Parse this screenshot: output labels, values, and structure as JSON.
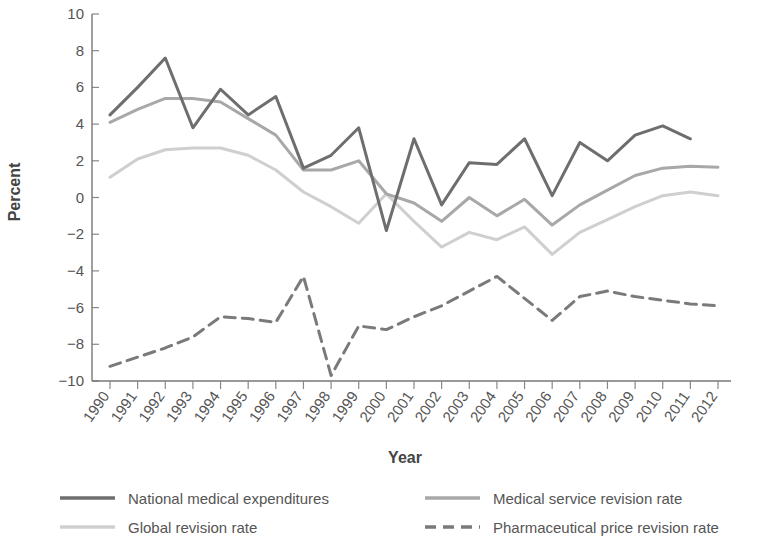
{
  "chart_data": {
    "type": "line",
    "title": "",
    "xlabel": "Year",
    "ylabel": "Percent",
    "grid": false,
    "legend_position": "bottom",
    "ylim": [
      -10,
      10
    ],
    "yticks": [
      "10",
      "8",
      "6",
      "4",
      "2",
      "0",
      "−2",
      "−4",
      "−6",
      "−8",
      "−10"
    ],
    "ytick_values": [
      10,
      8,
      6,
      4,
      2,
      0,
      -2,
      -4,
      -6,
      -8,
      -10
    ],
    "categories": [
      "1990",
      "1991",
      "1992",
      "1993",
      "1994",
      "1995",
      "1996",
      "1997",
      "1998",
      "1999",
      "2000",
      "2001",
      "2002",
      "2003",
      "2004",
      "2005",
      "2006",
      "2007",
      "2008",
      "2009",
      "2010",
      "2011",
      "2012"
    ],
    "series": [
      {
        "name": "National medical expenditures",
        "color": "#6e6e6e",
        "style": "solid",
        "width": 3,
        "values": [
          4.5,
          6.0,
          7.6,
          3.8,
          5.9,
          4.5,
          5.5,
          1.6,
          2.3,
          3.8,
          -1.8,
          3.2,
          -0.4,
          1.9,
          1.8,
          3.2,
          0.1,
          3.0,
          2.0,
          3.4,
          3.9,
          3.2,
          null
        ]
      },
      {
        "name": "Medical service revision rate",
        "color": "#a8a8a8",
        "style": "solid",
        "width": 3,
        "values": [
          4.1,
          4.8,
          5.4,
          5.4,
          5.2,
          4.3,
          3.4,
          1.5,
          1.5,
          2.0,
          0.2,
          -0.3,
          -1.3,
          0.0,
          -1.0,
          -0.1,
          -1.5,
          -0.4,
          0.4,
          1.2,
          1.6,
          1.7,
          1.65
        ]
      },
      {
        "name": "Global revision rate",
        "color": "#cfcfcf",
        "style": "solid",
        "width": 3,
        "values": [
          1.1,
          2.1,
          2.6,
          2.7,
          2.7,
          2.3,
          1.5,
          0.3,
          -0.5,
          -1.4,
          0.2,
          -1.3,
          -2.7,
          -1.9,
          -2.3,
          -1.6,
          -3.1,
          -1.9,
          -1.2,
          -0.5,
          0.1,
          0.3,
          0.1
        ]
      },
      {
        "name": "Pharmaceutical price revision rate",
        "color": "#7a7a7a",
        "style": "dashed",
        "width": 3,
        "values": [
          -9.2,
          -8.7,
          -8.2,
          -7.6,
          -6.5,
          -6.6,
          -6.8,
          -4.3,
          -9.7,
          -7.0,
          -7.2,
          -6.5,
          -5.9,
          -5.1,
          -4.3,
          -5.5,
          -6.7,
          -5.4,
          -5.1,
          -5.4,
          -5.6,
          -5.8,
          -5.9
        ]
      }
    ]
  },
  "legend": {
    "entries": [
      {
        "label": "National medical expenditures",
        "color": "#6e6e6e",
        "style": "solid"
      },
      {
        "label": "Medical service revision rate",
        "color": "#a8a8a8",
        "style": "solid"
      },
      {
        "label": "Global revision rate",
        "color": "#cfcfcf",
        "style": "solid"
      },
      {
        "label": "Pharmaceutical price revision rate",
        "color": "#7a7a7a",
        "style": "dashed"
      }
    ]
  }
}
